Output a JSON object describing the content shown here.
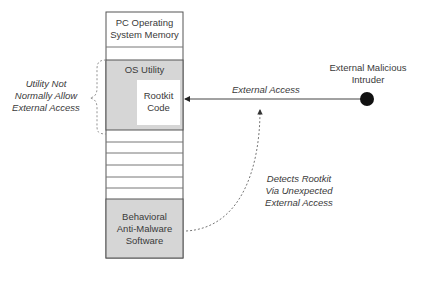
{
  "memory": {
    "title_line1": "PC Operating",
    "title_line2": "System Memory",
    "os_utility": "OS Utility",
    "rootkit_line1": "Rootkit",
    "rootkit_line2": "Code",
    "antimalware_line1": "Behavioral",
    "antimalware_line2": "Anti-Malware",
    "antimalware_line3": "Software"
  },
  "annotations": {
    "utility_line1": "Utility Not",
    "utility_line2": "Normally Allow",
    "utility_line3": "External Access",
    "external_access": "External Access",
    "detects_line1": "Detects Rootkit",
    "detects_line2": "Via Unexpected",
    "detects_line3": "External Access"
  },
  "intruder": {
    "line1": "External Malicious",
    "line2": "Intruder"
  },
  "colors": {
    "gray_fill": "#d6d6d6",
    "border": "#555555",
    "dashed": "#777777"
  }
}
